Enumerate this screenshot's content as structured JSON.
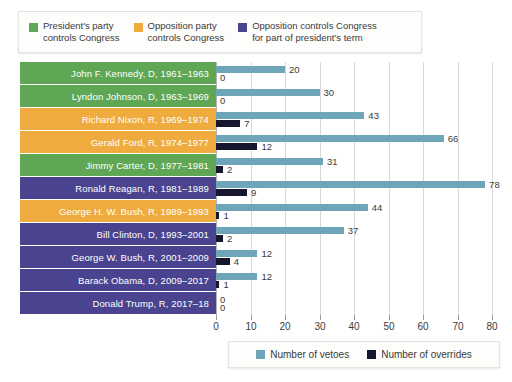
{
  "top_legend": {
    "items": [
      {
        "name": "pres-party-controls",
        "label": "President's party\ncontrols Congress",
        "color": "#5fa755"
      },
      {
        "name": "opposition-controls",
        "label": "Opposition party\ncontrols Congress",
        "color": "#efab3e"
      },
      {
        "name": "opposition-part-term",
        "label": "Opposition controls Congress\nfor part of president's term",
        "color": "#4a4490"
      }
    ]
  },
  "bottom_legend": {
    "items": [
      {
        "name": "number-of-vetoes",
        "label": "Number of vetoes",
        "color": "#6ea5b8"
      },
      {
        "name": "number-of-overrides",
        "label": "Number of overrides",
        "color": "#16162e"
      }
    ]
  },
  "chart_data": {
    "type": "bar",
    "orientation": "horizontal",
    "title": "",
    "xlabel": "",
    "ylabel": "",
    "xlim": [
      0,
      80
    ],
    "xticks": [
      0,
      10,
      20,
      30,
      40,
      50,
      60,
      70,
      80
    ],
    "grid": true,
    "legend_position": "bottom-right",
    "categories": [
      "John F. Kennedy, D, 1961–1963",
      "Lyndon Johnson, D, 1963–1969",
      "Richard Nixon, R, 1969–1974",
      "Gerald Ford, R, 1974–1977",
      "Jimmy Carter, D, 1977–1981",
      "Ronald Reagan, R, 1981–1989",
      "George H. W. Bush, R, 1989–1993",
      "Bill Clinton, D, 1993–2001",
      "George W. Bush, R, 2001–2009",
      "Barack Obama, D, 2009–2017",
      "Donald Trump, R, 2017–18"
    ],
    "category_colors": [
      "#5fa755",
      "#5fa755",
      "#efab3e",
      "#efab3e",
      "#5fa755",
      "#4a4490",
      "#efab3e",
      "#4a4490",
      "#4a4490",
      "#4a4490",
      "#4a4490"
    ],
    "series": [
      {
        "name": "Number of vetoes",
        "color": "#6ea5b8",
        "values": [
          20,
          30,
          43,
          66,
          31,
          78,
          44,
          37,
          12,
          12,
          0
        ]
      },
      {
        "name": "Number of overrides",
        "color": "#16162e",
        "values": [
          0,
          0,
          7,
          12,
          2,
          9,
          1,
          2,
          4,
          1,
          0
        ]
      }
    ]
  }
}
